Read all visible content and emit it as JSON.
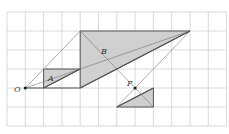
{
  "diagram": {
    "title": "",
    "grid": {
      "cols": 12,
      "rows": 6,
      "origin_px": [
        7,
        12
      ],
      "cell_w": 18.3,
      "cell_h": 19,
      "color": "#d0d0d0"
    },
    "colors": {
      "fill": "#cfcfcf",
      "thick": "#555555",
      "thin": "#777777",
      "point": "#222222"
    },
    "points": {
      "O": {
        "label": "O",
        "x": 1,
        "y": 4
      },
      "A": {
        "label": "A",
        "x": 2.45,
        "y": 3.55
      },
      "B": {
        "label": "B",
        "x": 5.35,
        "y": 2.25
      },
      "P": {
        "label": "P",
        "x": 7,
        "y": 4
      }
    },
    "labels": {
      "O": "O",
      "A": "A",
      "B": "B",
      "P": "P"
    },
    "shaded_triangles": [
      [
        [
          2,
          3
        ],
        [
          4,
          3
        ],
        [
          2,
          4
        ]
      ],
      [
        [
          4,
          1
        ],
        [
          10,
          1
        ],
        [
          4,
          4
        ]
      ],
      [
        [
          8,
          4
        ],
        [
          8,
          5
        ],
        [
          6,
          5
        ]
      ]
    ],
    "thin_lines": [
      [
        [
          1,
          4
        ],
        [
          4,
          1
        ]
      ],
      [
        [
          1,
          4
        ],
        [
          10,
          1
        ]
      ],
      [
        [
          10,
          1
        ],
        [
          6,
          5
        ]
      ],
      [
        [
          4,
          1
        ],
        [
          8,
          5
        ]
      ]
    ],
    "thick_lines": [
      [
        [
          1,
          4
        ],
        [
          4,
          4
        ]
      ],
      [
        [
          2,
          4
        ],
        [
          4,
          3
        ]
      ],
      [
        [
          4,
          4
        ],
        [
          10,
          1
        ]
      ],
      [
        [
          6,
          5
        ],
        [
          8,
          4
        ]
      ]
    ]
  }
}
